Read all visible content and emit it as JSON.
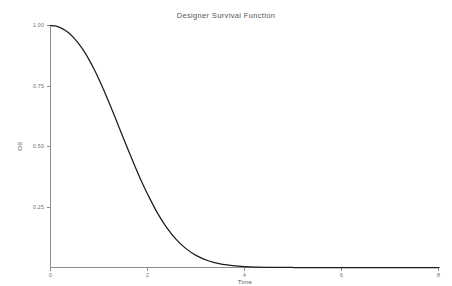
{
  "chart_data": {
    "type": "line",
    "title": "Designer Survival Function",
    "xlabel": "Time",
    "ylabel": "OS",
    "xlim": [
      0,
      8
    ],
    "ylim": [
      0,
      1.0
    ],
    "grid": false,
    "legend": "none",
    "xticks": [
      0,
      2,
      4,
      6,
      8
    ],
    "xtick_labels": [
      "0",
      "2",
      "4",
      "6",
      "8"
    ],
    "yticks": [
      0.25,
      0.5,
      0.75,
      1.0
    ],
    "ytick_labels": [
      "0.25",
      "0.50",
      "0.75",
      "1.00"
    ],
    "series": [
      {
        "name": "Survival",
        "color": "#1c1c1c",
        "x": [
          0.0,
          0.1,
          0.2,
          0.3,
          0.4,
          0.5,
          0.6,
          0.7,
          0.8,
          0.9,
          1.0,
          1.1,
          1.2,
          1.3,
          1.4,
          1.5,
          1.6,
          1.7,
          1.8,
          1.9,
          2.0,
          2.2,
          2.4,
          2.6,
          2.8,
          3.0,
          3.25,
          3.5,
          3.75,
          4.0,
          4.5,
          5.0,
          5.5,
          6.0,
          6.5,
          7.0,
          7.5,
          8.0
        ],
        "y": [
          1.0,
          0.998,
          0.991,
          0.98,
          0.965,
          0.945,
          0.92,
          0.891,
          0.857,
          0.819,
          0.777,
          0.732,
          0.685,
          0.636,
          0.586,
          0.536,
          0.487,
          0.438,
          0.391,
          0.346,
          0.304,
          0.227,
          0.164,
          0.114,
          0.077,
          0.05,
          0.028,
          0.015,
          0.008,
          0.004,
          0.001,
          0.0,
          0.0,
          0.0,
          0.0,
          0.0,
          0.0,
          0.0
        ]
      }
    ]
  },
  "axes": {
    "y_axis_name": "os-axis",
    "x_axis_name": "time-axis"
  }
}
